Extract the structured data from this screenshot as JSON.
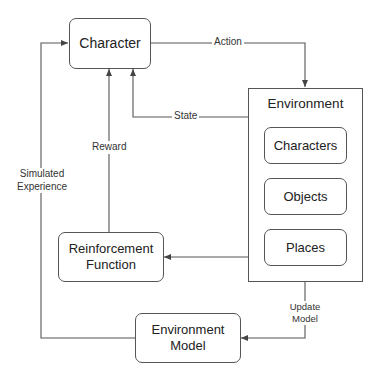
{
  "diagram": {
    "nodes": {
      "character": "Character",
      "environment": "Environment",
      "characters": "Characters",
      "objects": "Objects",
      "places": "Places",
      "reinforcement_function_line1": "Reinforcement",
      "reinforcement_function_line2": "Function",
      "environment_model_line1": "Environment",
      "environment_model_line2": "Model"
    },
    "edges": {
      "action": "Action",
      "state": "State",
      "reward": "Reward",
      "simulated_experience_line1": "Simulated",
      "simulated_experience_line2": "Experience",
      "update_model_line1": "Update",
      "update_model_line2": "Model"
    },
    "colors": {
      "line": "#555555",
      "background": "#ffffff",
      "text": "#222222"
    }
  }
}
